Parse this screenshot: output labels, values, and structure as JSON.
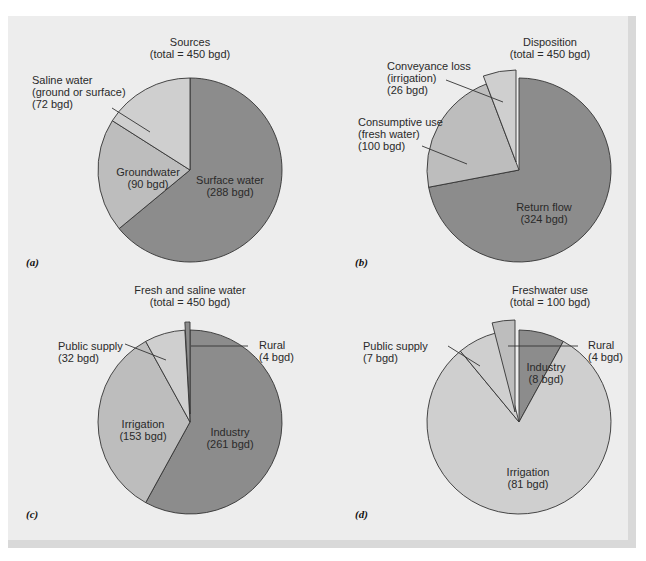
{
  "colors": {
    "dark": "#8c8c8c",
    "medium": "#bdbdbd",
    "light": "#cfcfcf",
    "stroke": "#333333"
  },
  "chart_data": [
    {
      "type": "pie",
      "panel_label": "(a)",
      "title": "Sources",
      "subtitle": "(total = 450 bgd)",
      "unit": "bgd",
      "total": 450,
      "slices": [
        {
          "name": "Surface water",
          "value": 288,
          "label_lines": [
            "Surface water",
            "(288 bgd)"
          ],
          "shade": "dark",
          "exploded": false
        },
        {
          "name": "Groundwater",
          "value": 90,
          "label_lines": [
            "Groundwater",
            "(90 bgd)"
          ],
          "shade": "medium",
          "exploded": false
        },
        {
          "name": "Saline water (ground or surface)",
          "value": 72,
          "label_lines": [
            "Saline water",
            "(ground or surface)",
            "(72 bgd)"
          ],
          "shade": "light",
          "exploded": false
        }
      ]
    },
    {
      "type": "pie",
      "panel_label": "(b)",
      "title": "Disposition",
      "subtitle": "(total = 450 bgd)",
      "unit": "bgd",
      "total": 450,
      "slices": [
        {
          "name": "Return flow",
          "value": 324,
          "label_lines": [
            "Return flow",
            "(324 bgd)"
          ],
          "shade": "dark",
          "exploded": false
        },
        {
          "name": "Consumptive use (fresh water)",
          "value": 100,
          "label_lines": [
            "Consumptive use",
            "(fresh water)",
            "(100 bgd)"
          ],
          "shade": "medium",
          "exploded": false
        },
        {
          "name": "Conveyance loss (irrigation)",
          "value": 26,
          "label_lines": [
            "Conveyance loss",
            "(irrigation)",
            "(26 bgd)"
          ],
          "shade": "light",
          "exploded": true
        }
      ]
    },
    {
      "type": "pie",
      "panel_label": "(c)",
      "title": "Fresh and saline water",
      "subtitle": "(total = 450 bgd)",
      "unit": "bgd",
      "total": 450,
      "slices": [
        {
          "name": "Industry",
          "value": 261,
          "label_lines": [
            "Industry",
            "(261 bgd)"
          ],
          "shade": "dark",
          "exploded": false
        },
        {
          "name": "Irrigation",
          "value": 153,
          "label_lines": [
            "Irrigation",
            "(153 bgd)"
          ],
          "shade": "medium",
          "exploded": false
        },
        {
          "name": "Public supply",
          "value": 32,
          "label_lines": [
            "Public supply",
            "(32 bgd)"
          ],
          "shade": "light",
          "exploded": false
        },
        {
          "name": "Rural",
          "value": 4,
          "label_lines": [
            "Rural",
            "(4 bgd)"
          ],
          "shade": "dark",
          "exploded": true
        }
      ]
    },
    {
      "type": "pie",
      "panel_label": "(d)",
      "title": "Freshwater use",
      "subtitle": "(total = 100 bgd)",
      "unit": "bgd",
      "total": 100,
      "slices": [
        {
          "name": "Industry",
          "value": 8,
          "label_lines": [
            "Industry",
            "(8 bgd)"
          ],
          "shade": "dark",
          "exploded": false
        },
        {
          "name": "Irrigation",
          "value": 81,
          "label_lines": [
            "Irrigation",
            "(81 bgd)"
          ],
          "shade": "light",
          "exploded": false
        },
        {
          "name": "Public supply",
          "value": 7,
          "label_lines": [
            "Public supply",
            "(7 bgd)"
          ],
          "shade": "light",
          "exploded": false
        },
        {
          "name": "Rural",
          "value": 4,
          "label_lines": [
            "Rural",
            "(4 bgd)"
          ],
          "shade": "medium",
          "exploded": true
        }
      ]
    }
  ]
}
